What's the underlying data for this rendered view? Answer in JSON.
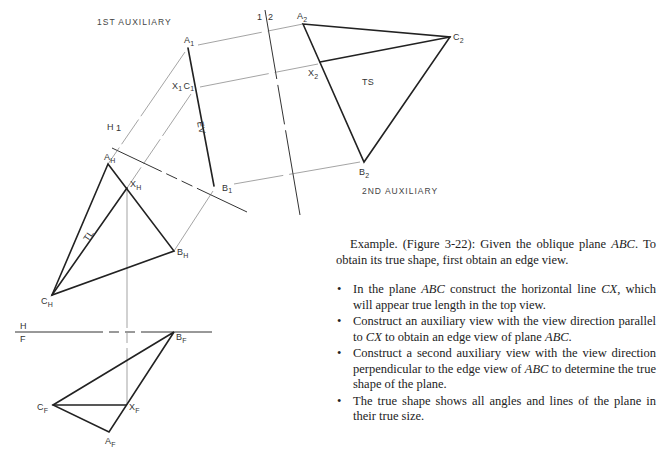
{
  "figure": {
    "captions": {
      "first_auxiliary": "1ST AUXILIARY",
      "second_auxiliary": "2ND AUXILIARY"
    },
    "fold_lines": {
      "h_1": {
        "top": "1",
        "bottom": "H"
      },
      "one_two": {
        "left": "1",
        "right": "2"
      },
      "h_f": {
        "top": "H",
        "bottom": "F"
      }
    },
    "annotations": {
      "edge_view": "EV",
      "true_length": "TL",
      "true_shape": "TS"
    },
    "points": {
      "first_aux": {
        "A": "A",
        "A_sub": "1",
        "XC": "X",
        "XC_sub1": "1",
        "C": "C",
        "C_sub": "1",
        "B": "B",
        "B_sub": "1"
      },
      "second_aux": {
        "A": "A",
        "A_sub": "2",
        "C": "C",
        "C_sub": "2",
        "X": "X",
        "X_sub": "2",
        "B": "B",
        "B_sub": "2"
      },
      "top": {
        "A": "A",
        "A_sub": "H",
        "X": "X",
        "X_sub": "H",
        "B": "B",
        "B_sub": "H",
        "C": "C",
        "C_sub": "H"
      },
      "front": {
        "B": "B",
        "B_sub": "F",
        "C": "C",
        "C_sub": "F",
        "X": "X",
        "X_sub": "F",
        "A": "A",
        "A_sub": "F"
      }
    }
  },
  "text": {
    "intro_1": "Example. (Figure 3-22): Given the oblique plane ",
    "intro_abc": "ABC",
    "intro_2": ". To obtain its true shape, first obtain an edge view.",
    "bullets": [
      {
        "a": "In the plane ",
        "b": "ABC",
        "c": " construct the horizontal line ",
        "d": "CX",
        "e": ", which will appear true length in the top view."
      },
      {
        "a": "Construct an auxiliary view with the view direction parallel to ",
        "b": "CX",
        "c": " to obtain an edge view of plane ",
        "d": "ABC",
        "e": "."
      },
      {
        "a": "Construct a second auxiliary view with the view direction perpendicular to the edge view of ",
        "b": "ABC",
        "c": " to determine the true shape of the plane.",
        "d": "",
        "e": ""
      },
      {
        "a": "The true shape shows all angles and lines of the plane in their true size.",
        "b": "",
        "c": "",
        "d": "",
        "e": ""
      }
    ]
  }
}
